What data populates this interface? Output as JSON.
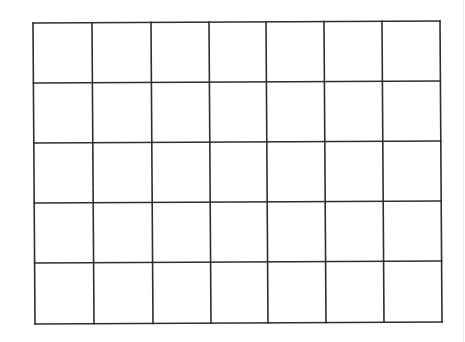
{
  "diagram": {
    "type": "empty-grid",
    "columns": 7,
    "rows": 5,
    "line_color": "#2e2e2e",
    "line_width": 1.6,
    "background": "#ffffff",
    "corners": {
      "top_left": [
        33,
        23
      ],
      "top_right": [
        440,
        21
      ],
      "bottom_left": [
        35,
        324
      ],
      "bottom_right": [
        442,
        322
      ]
    },
    "vertical_lines_top_x": [
      33,
      92,
      151,
      209,
      266,
      324,
      382,
      440
    ],
    "vertical_lines_bottom_x": [
      35,
      94,
      153,
      211,
      268,
      326,
      384,
      442
    ],
    "horizontal_lines_left_y": [
      23,
      83,
      143,
      203,
      263,
      324
    ],
    "horizontal_lines_right_y": [
      21,
      81,
      141,
      201,
      261,
      322
    ]
  },
  "frame": {
    "right_edge_line_x": 463,
    "right_edge_line_color": "#ececec"
  }
}
